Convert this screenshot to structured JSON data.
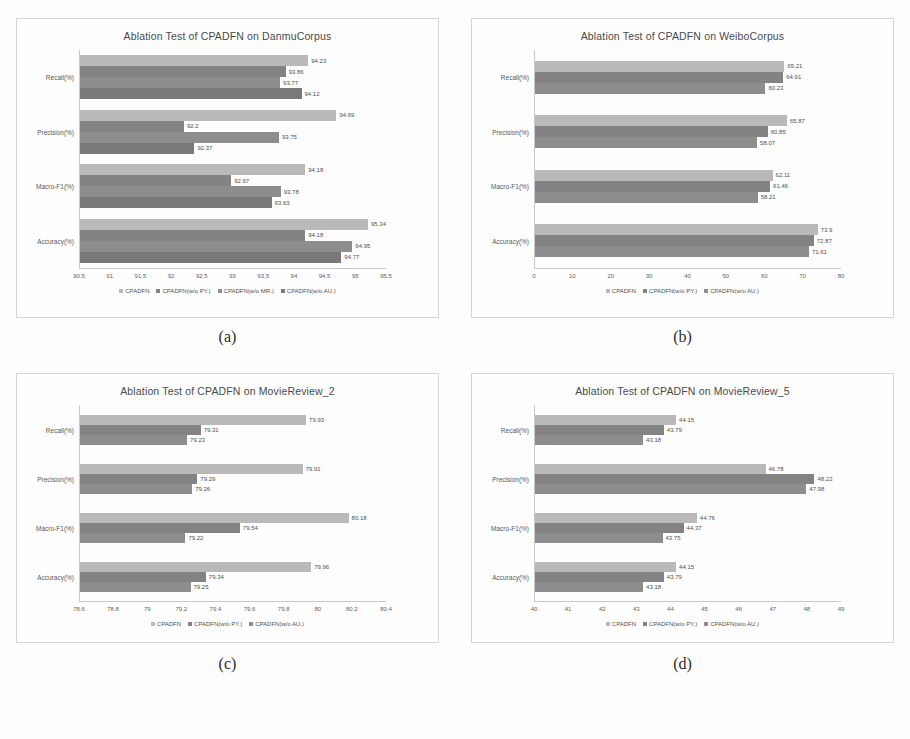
{
  "figure": {
    "panels": [
      {
        "caption": "(a)",
        "chart_data": {
          "type": "bar",
          "orientation": "horizontal",
          "title": "Ablation Test of CPADFN on DanmuCorpus",
          "xlabel": "",
          "ylabel": "",
          "xlim": [
            90.5,
            95.5
          ],
          "xticks": [
            "90.5",
            "91",
            "91.5",
            "92",
            "92.5",
            "93",
            "93.5",
            "94",
            "94.5",
            "95",
            "95.5"
          ],
          "grid": false,
          "legend_position": "bottom",
          "categories": [
            "Recall(%)",
            "Precision(%)",
            "Macro-F1(%)",
            "Accuracy(%)"
          ],
          "series": [
            {
              "name": "CPADFN",
              "values": [
                94.23,
                94.69,
                94.18,
                95.34
              ]
            },
            {
              "name": "CPADFN(w/o PY.)",
              "values": [
                93.86,
                92.2,
                92.97,
                94.18
              ]
            },
            {
              "name": "CPADFN(w/o MR.)",
              "values": [
                93.77,
                93.75,
                93.78,
                94.95
              ]
            },
            {
              "name": "CPADFN(w/o AU.)",
              "values": [
                94.12,
                92.37,
                93.63,
                94.77
              ]
            }
          ]
        }
      },
      {
        "caption": "(b)",
        "chart_data": {
          "type": "bar",
          "orientation": "horizontal",
          "title": "Ablation Test of CPADFN on WeiboCorpus",
          "xlabel": "",
          "ylabel": "",
          "xlim": [
            0,
            80
          ],
          "xticks": [
            "0",
            "10",
            "20",
            "30",
            "40",
            "50",
            "60",
            "70",
            "80"
          ],
          "grid": false,
          "legend_position": "bottom",
          "categories": [
            "Recall(%)",
            "Precision(%)",
            "Macro-F1(%)",
            "Accuracy(%)"
          ],
          "series": [
            {
              "name": "CPADFN",
              "values": [
                65.21,
                65.87,
                62.11,
                73.9
              ]
            },
            {
              "name": "CPADFN(w/o PY.)",
              "values": [
                64.91,
                60.85,
                61.46,
                72.87
              ]
            },
            {
              "name": "CPADFN(w/o AU.)",
              "values": [
                60.23,
                58.07,
                58.21,
                71.61
              ]
            }
          ]
        }
      },
      {
        "caption": "(c)",
        "chart_data": {
          "type": "bar",
          "orientation": "horizontal",
          "title": "Ablation Test of CPADFN on MovieReview_2",
          "xlabel": "",
          "ylabel": "",
          "xlim": [
            78.6,
            80.4
          ],
          "xticks": [
            "78.6",
            "78.8",
            "79",
            "79.2",
            "79.4",
            "79.6",
            "79.8",
            "80",
            "80.2",
            "80.4"
          ],
          "grid": false,
          "legend_position": "bottom",
          "categories": [
            "Recall(%)",
            "Precision(%)",
            "Macro-F1(%)",
            "Accuracy(%)"
          ],
          "series": [
            {
              "name": "CPADFN",
              "values": [
                79.93,
                79.91,
                80.18,
                79.96
              ]
            },
            {
              "name": "CPADFN(w/o PY.)",
              "values": [
                79.31,
                79.29,
                79.54,
                79.34
              ]
            },
            {
              "name": "CPADFN(w/o AU.)",
              "values": [
                79.23,
                79.26,
                79.22,
                79.25
              ]
            }
          ]
        }
      },
      {
        "caption": "(d)",
        "chart_data": {
          "type": "bar",
          "orientation": "horizontal",
          "title": "Ablation Test of CPADFN on MovieReview_5",
          "xlabel": "",
          "ylabel": "",
          "xlim": [
            40,
            49
          ],
          "xticks": [
            "40",
            "41",
            "42",
            "43",
            "44",
            "45",
            "46",
            "47",
            "48",
            "49"
          ],
          "grid": false,
          "legend_position": "bottom",
          "categories": [
            "Recall(%)",
            "Precision(%)",
            "Macro-F1(%)",
            "Accuracy(%)"
          ],
          "series": [
            {
              "name": "CPADFN",
              "values": [
                44.15,
                46.78,
                44.76,
                44.15
              ]
            },
            {
              "name": "CPADFN(w/o PY.)",
              "values": [
                43.79,
                48.22,
                44.37,
                43.79
              ]
            },
            {
              "name": "CPADFN(w/o AU.)",
              "values": [
                43.18,
                47.98,
                43.75,
                43.18
              ]
            }
          ]
        }
      }
    ]
  }
}
